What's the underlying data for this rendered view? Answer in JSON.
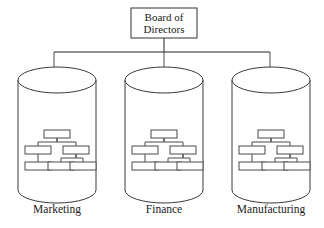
{
  "diagram": {
    "type": "organizational-structure",
    "canvas": {
      "width": 324,
      "height": 228,
      "background": "#ffffff"
    },
    "line_color": "#222222",
    "text_color": "#1a1a1a",
    "root": {
      "name": "board-of-directors",
      "label_line_1": "Board of",
      "label_line_2": "Directors",
      "box": {
        "x": 131,
        "y": 8,
        "width": 66,
        "height": 30
      }
    },
    "bus": {
      "stem_x": 164,
      "stem_top": 38,
      "rail_y": 52,
      "rail_left_x": 54,
      "rail_right_x": 270
    },
    "units": [
      {
        "name": "marketing",
        "label": "Marketing",
        "cylinder": {
          "cx": 57,
          "top_y": 80,
          "bottom_y": 190,
          "rx": 39,
          "ry": 13
        },
        "drop_x": 54,
        "label_y": 210
      },
      {
        "name": "finance",
        "label": "Finance",
        "cylinder": {
          "cx": 164,
          "top_y": 80,
          "bottom_y": 190,
          "rx": 39,
          "ry": 13
        },
        "drop_x": 164,
        "label_y": 210
      },
      {
        "name": "manufacturing",
        "label": "Manufacturing",
        "cylinder": {
          "cx": 271,
          "top_y": 80,
          "bottom_y": 190,
          "rx": 39,
          "ry": 13
        },
        "drop_x": 270,
        "label_y": 210
      }
    ],
    "inner_chart": {
      "description": "Five-box hierarchy inside each unit cylinder",
      "box_width": 26,
      "box_height": 8,
      "levels": [
        {
          "level": 1,
          "count": 1,
          "offsets_x": [
            0
          ],
          "y": 130
        },
        {
          "level": 2,
          "count": 2,
          "offsets_x": [
            -19,
            19
          ],
          "y": 146
        },
        {
          "level": 3,
          "count": 3,
          "offsets_x": [
            -19,
            4,
            26
          ],
          "y": 162
        }
      ],
      "edges": [
        {
          "from": "L1-0",
          "to": "L2-0"
        },
        {
          "from": "L1-0",
          "to": "L2-1"
        },
        {
          "from": "L2-0",
          "to": "L3-0"
        },
        {
          "from": "L2-1",
          "to": "L3-1"
        },
        {
          "from": "L2-1",
          "to": "L3-2"
        }
      ]
    }
  }
}
